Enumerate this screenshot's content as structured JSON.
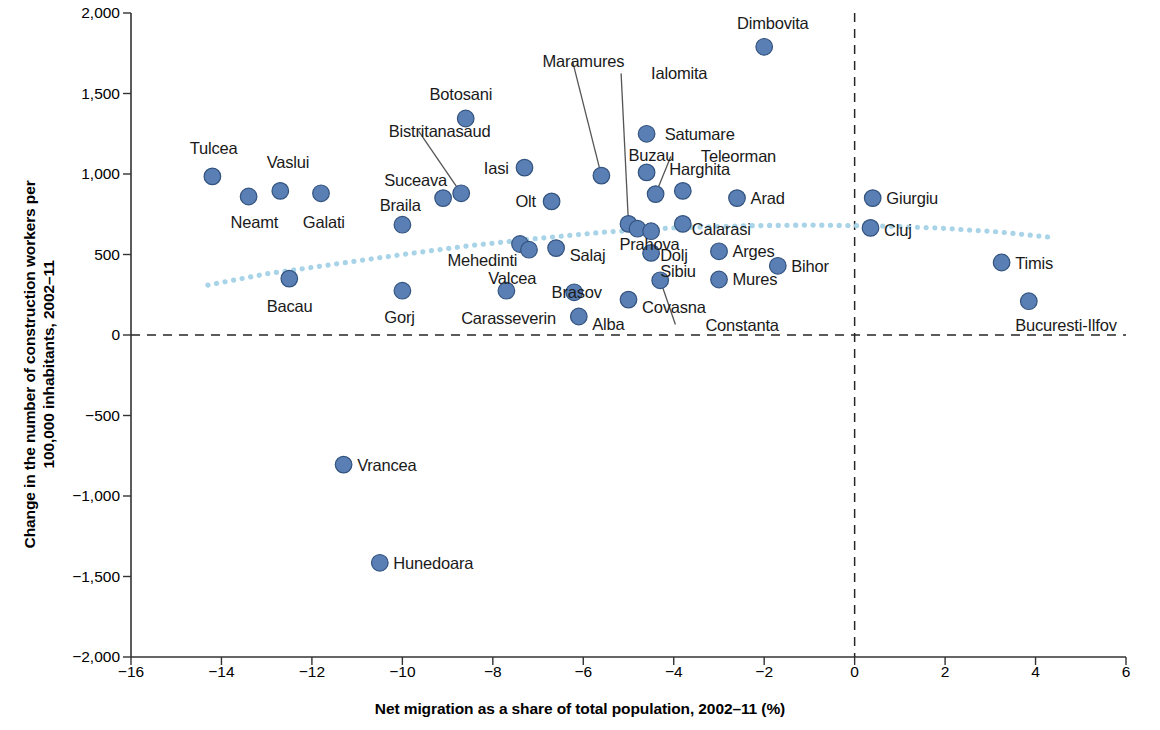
{
  "chart_data": {
    "type": "scatter",
    "title": "",
    "xlabel": "Net migration as a share of total population, 2002–11 (%)",
    "ylabel": "Change in the number of construction workers per 100,000 inhabitants, 2002–11",
    "ylabel_line1": "Change in the number of construction workers per",
    "ylabel_line2": "100,000 inhabitants, 2002–11",
    "xlim": [
      -16,
      6
    ],
    "ylim": [
      -2000,
      2000
    ],
    "xticks": [
      -16,
      -14,
      -12,
      -10,
      -8,
      -6,
      -4,
      -2,
      0,
      2,
      4,
      6
    ],
    "xtick_labels": [
      "−16",
      "−14",
      "−12",
      "−10",
      "−8",
      "−6",
      "−4",
      "−2",
      "0",
      "2",
      "4",
      "6"
    ],
    "yticks": [
      -2000,
      -1500,
      -1000,
      -500,
      0,
      500,
      1000,
      1500,
      2000
    ],
    "ytick_labels": [
      "−2,000",
      "−1,500",
      "−1,000",
      "−500",
      "0",
      "500",
      "1,000",
      "1,500",
      "2,000"
    ],
    "grid": false,
    "legend": null,
    "reference_lines": [
      {
        "name": "zero-y",
        "orientation": "horizontal",
        "value": 0,
        "style": "dashed"
      },
      {
        "name": "zero-x",
        "orientation": "vertical",
        "value": 0,
        "style": "dashed"
      }
    ],
    "trend_line": {
      "name": "fitted-trend",
      "style": "dotted",
      "color": "#a9d4e8",
      "points": [
        {
          "x": -14.3,
          "y": 310
        },
        {
          "x": -13.0,
          "y": 380
        },
        {
          "x": -11.5,
          "y": 440
        },
        {
          "x": -10.0,
          "y": 500
        },
        {
          "x": -8.5,
          "y": 555
        },
        {
          "x": -7.0,
          "y": 600
        },
        {
          "x": -5.5,
          "y": 640
        },
        {
          "x": -4.0,
          "y": 665
        },
        {
          "x": -2.5,
          "y": 678
        },
        {
          "x": -1.0,
          "y": 683
        },
        {
          "x": 0.4,
          "y": 678
        },
        {
          "x": 1.8,
          "y": 665
        },
        {
          "x": 3.2,
          "y": 640
        },
        {
          "x": 4.4,
          "y": 605
        }
      ]
    },
    "series_name": "Romanian counties",
    "point_color": "#5a7fb4",
    "point_edge_color": "#33537f",
    "points": [
      {
        "label": "Tulcea",
        "x": -14.2,
        "y": 985,
        "lx": -14.7,
        "ly": 1160,
        "anchor": "start"
      },
      {
        "label": "Vaslui",
        "x": -12.7,
        "y": 895,
        "lx": -13.0,
        "ly": 1075,
        "anchor": "start"
      },
      {
        "label": "Neamt",
        "x": -13.4,
        "y": 860,
        "lx": -13.8,
        "ly": 700,
        "anchor": "start"
      },
      {
        "label": "Galati",
        "x": -11.8,
        "y": 880,
        "lx": -12.2,
        "ly": 700,
        "anchor": "start"
      },
      {
        "label": "Bacau",
        "x": -12.5,
        "y": 350,
        "lx": -13.0,
        "ly": 180,
        "anchor": "start"
      },
      {
        "label": "Bistritanasaud",
        "x": -8.7,
        "y": 880,
        "lx": -10.3,
        "ly": 1265,
        "anchor": "start",
        "leader": true
      },
      {
        "label": "Suceava",
        "x": -9.1,
        "y": 850,
        "lx": -10.4,
        "ly": 960,
        "anchor": "start"
      },
      {
        "label": "Braila",
        "x": -10.0,
        "y": 685,
        "lx": -10.5,
        "ly": 805,
        "anchor": "start"
      },
      {
        "label": "Botosani",
        "x": -8.6,
        "y": 1345,
        "lx": -9.4,
        "ly": 1495,
        "anchor": "start"
      },
      {
        "label": "Gorj",
        "x": -10.0,
        "y": 275,
        "lx": -10.4,
        "ly": 110,
        "anchor": "start"
      },
      {
        "label": "Mehedinti",
        "x": -7.4,
        "y": 565,
        "lx": -9.0,
        "ly": 465,
        "anchor": "start"
      },
      {
        "label": "Valcea",
        "x": -7.2,
        "y": 530,
        "lx": -8.1,
        "ly": 355,
        "anchor": "start"
      },
      {
        "label": "Carasseverin",
        "x": -7.7,
        "y": 275,
        "lx": -8.7,
        "ly": 105,
        "anchor": "start"
      },
      {
        "label": "Iasi",
        "x": -7.3,
        "y": 1040,
        "lx": -8.2,
        "ly": 1040,
        "anchor": "start"
      },
      {
        "label": "Olt",
        "x": -6.7,
        "y": 830,
        "lx": -7.5,
        "ly": 835,
        "anchor": "start"
      },
      {
        "label": "Salaj",
        "x": -6.6,
        "y": 540,
        "lx": -6.3,
        "ly": 500,
        "anchor": "start"
      },
      {
        "label": "Brasov",
        "x": -6.2,
        "y": 265,
        "lx": -6.7,
        "ly": 265,
        "anchor": "start"
      },
      {
        "label": "Alba",
        "x": -6.1,
        "y": 115,
        "lx": -5.8,
        "ly": 70,
        "anchor": "start"
      },
      {
        "label": "Maramures",
        "x": -5.6,
        "y": 990,
        "lx": -6.9,
        "ly": 1700,
        "anchor": "start",
        "leader": true
      },
      {
        "label": "Ialomita",
        "x": -5.0,
        "y": 690,
        "lx": -4.5,
        "ly": 1625,
        "anchor": "start",
        "leader": true
      },
      {
        "label": "Prahova",
        "x": -4.8,
        "y": 660,
        "lx": -5.2,
        "ly": 565,
        "anchor": "start"
      },
      {
        "label": "Dolj",
        "x": -4.5,
        "y": 645,
        "lx": -4.3,
        "ly": 500,
        "anchor": "start"
      },
      {
        "label": "Sibiu",
        "x": -4.5,
        "y": 510,
        "lx": -4.3,
        "ly": 395,
        "anchor": "start"
      },
      {
        "label": "Covasna",
        "x": -5.0,
        "y": 220,
        "lx": -4.7,
        "ly": 175,
        "anchor": "start"
      },
      {
        "label": "Constanta",
        "x": -4.3,
        "y": 340,
        "lx": -3.3,
        "ly": 65,
        "anchor": "start",
        "leader": true
      },
      {
        "label": "Buzau",
        "x": -4.6,
        "y": 1010,
        "lx": -5.0,
        "ly": 1120,
        "anchor": "start"
      },
      {
        "label": "Satumare",
        "x": -4.6,
        "y": 1250,
        "lx": -4.2,
        "ly": 1250,
        "anchor": "start"
      },
      {
        "label": "Teleorman",
        "x": -4.4,
        "y": 875,
        "lx": -3.4,
        "ly": 1110,
        "anchor": "start",
        "leader": true
      },
      {
        "label": "Harghita",
        "x": -3.8,
        "y": 895,
        "lx": -4.1,
        "ly": 1030,
        "anchor": "start"
      },
      {
        "label": "Calarasi",
        "x": -3.8,
        "y": 690,
        "lx": -3.6,
        "ly": 660,
        "anchor": "start"
      },
      {
        "label": "Arad",
        "x": -2.6,
        "y": 850,
        "lx": -2.3,
        "ly": 850,
        "anchor": "start"
      },
      {
        "label": "Arges",
        "x": -3.0,
        "y": 520,
        "lx": -2.7,
        "ly": 520,
        "anchor": "start"
      },
      {
        "label": "Mures",
        "x": -3.0,
        "y": 345,
        "lx": -2.7,
        "ly": 345,
        "anchor": "start"
      },
      {
        "label": "Bihor",
        "x": -1.7,
        "y": 430,
        "lx": -1.4,
        "ly": 430,
        "anchor": "start"
      },
      {
        "label": "Dimbovita",
        "x": -2.0,
        "y": 1790,
        "lx": -2.6,
        "ly": 1940,
        "anchor": "start"
      },
      {
        "label": "Giurgiu",
        "x": 0.4,
        "y": 850,
        "lx": 0.7,
        "ly": 850,
        "anchor": "start"
      },
      {
        "label": "Cluj",
        "x": 0.35,
        "y": 665,
        "lx": 0.65,
        "ly": 655,
        "anchor": "start"
      },
      {
        "label": "Timis",
        "x": 3.25,
        "y": 450,
        "lx": 3.55,
        "ly": 450,
        "anchor": "start"
      },
      {
        "label": "Bucuresti-Ilfov",
        "x": 3.85,
        "y": 210,
        "lx": 3.55,
        "ly": 60,
        "anchor": "start"
      },
      {
        "label": "Vrancea",
        "x": -11.3,
        "y": -805,
        "lx": -11.0,
        "ly": -805,
        "anchor": "start"
      },
      {
        "label": "Hunedoara",
        "x": -10.5,
        "y": -1415,
        "lx": -10.2,
        "ly": -1415,
        "anchor": "start"
      }
    ]
  }
}
